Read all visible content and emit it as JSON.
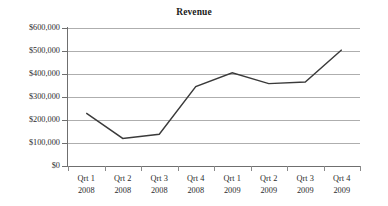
{
  "chart_data": {
    "type": "line",
    "title": "Revenue",
    "xlabel": "",
    "ylabel": "",
    "categories": [
      "Qrt 1 2008",
      "Qrt 2 2008",
      "Qrt 3 2008",
      "Qrt 4 2008",
      "Qrt 1 2009",
      "Qrt 2 2009",
      "Qrt 3 2009",
      "Qrt 4 2009"
    ],
    "category_lines": [
      [
        "Qrt 1",
        "2008"
      ],
      [
        "Qrt 2",
        "2008"
      ],
      [
        "Qrt 3",
        "2008"
      ],
      [
        "Qrt 4",
        "2008"
      ],
      [
        "Qrt 1",
        "2009"
      ],
      [
        "Qrt 2",
        "2009"
      ],
      [
        "Qrt 3",
        "2009"
      ],
      [
        "Qrt 4",
        "2009"
      ]
    ],
    "values": [
      230000,
      120000,
      138000,
      345000,
      405000,
      358000,
      365000,
      505000
    ],
    "series": [
      {
        "name": "Revenue",
        "values": [
          230000,
          120000,
          138000,
          345000,
          405000,
          358000,
          365000,
          505000
        ]
      }
    ],
    "ylim": [
      0,
      600000
    ],
    "ytick_values": [
      600000,
      500000,
      400000,
      300000,
      200000,
      100000,
      0
    ],
    "ytick_labels": [
      "$600,000",
      "$500,000",
      "$400,000",
      "$300,000",
      "$200,000",
      "$100,000",
      "$0"
    ],
    "grid": true,
    "legend": false,
    "legend_position": "none",
    "line_color": "#3a3a3a",
    "grid_color": "#aeaeae",
    "axis_color": "#6f6f6f",
    "markers": false
  }
}
